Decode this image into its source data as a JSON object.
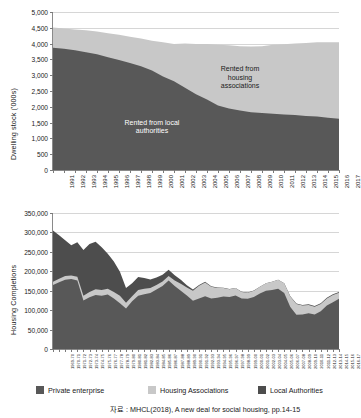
{
  "chart_data": [
    {
      "type": "area",
      "id": "dwelling-stock",
      "title": "",
      "xlabel": "",
      "ylabel": "Dwelling stock ('000s)",
      "ylim": [
        0,
        5000
      ],
      "yticks": [
        "0",
        "500",
        "1,000",
        "1,500",
        "2,000",
        "2,500",
        "3,000",
        "3,500",
        "4,000",
        "4,500",
        "5,000"
      ],
      "ytick_values": [
        0,
        500,
        1000,
        1500,
        2000,
        2500,
        3000,
        3500,
        4000,
        4500,
        5000
      ],
      "grid": true,
      "stacked": true,
      "legend_position": "in-plot-annotations",
      "categories": [
        "1991",
        "1992",
        "1993",
        "1994",
        "1995",
        "1996",
        "1997",
        "1998",
        "1999",
        "2000",
        "2001",
        "2002",
        "2003",
        "2004",
        "2005",
        "2006",
        "2007",
        "2008",
        "2009",
        "2010",
        "2011",
        "2012",
        "2013",
        "2014",
        "2015",
        "2016",
        "2017"
      ],
      "series": [
        {
          "name": "Rented from local authorities",
          "color": "#585858",
          "values": [
            3870,
            3840,
            3790,
            3730,
            3660,
            3570,
            3480,
            3390,
            3280,
            3150,
            2960,
            2810,
            2600,
            2400,
            2230,
            2040,
            1950,
            1880,
            1830,
            1800,
            1780,
            1760,
            1740,
            1710,
            1690,
            1650,
            1620
          ]
        },
        {
          "name": "Rented from housing associations",
          "color": "#c8c8c8",
          "values": [
            640,
            640,
            660,
            690,
            720,
            760,
            800,
            830,
            880,
            940,
            1080,
            1180,
            1400,
            1590,
            1760,
            1920,
            2000,
            2040,
            2080,
            2120,
            2180,
            2220,
            2260,
            2310,
            2350,
            2390,
            2420
          ]
        }
      ],
      "annotations": [
        {
          "text": "Rented from\nhousing\nassociations",
          "x": "2008",
          "y": 2950,
          "color": "#1a1a1a"
        },
        {
          "text": "Rented from local\nauthorities",
          "x": "2000",
          "y": 1250,
          "color": "#ffffff"
        }
      ]
    },
    {
      "type": "area",
      "id": "housing-completions",
      "title": "",
      "xlabel": "",
      "ylabel": "Housing Completions",
      "ylim": [
        0,
        350000
      ],
      "yticks": [
        "0",
        "50,000",
        "100,000",
        "150,000",
        "200,000",
        "250,000",
        "300,000",
        "350,000"
      ],
      "ytick_values": [
        0,
        50000,
        100000,
        150000,
        200000,
        250000,
        300000,
        350000
      ],
      "grid": true,
      "stacked": true,
      "legend_position": "bottom",
      "categories": [
        "1969-70",
        "1970-71",
        "1971-72",
        "1972-73",
        "1973-74",
        "1974-75",
        "1975-76",
        "1976-77",
        "1977-78",
        "1978-79",
        "1979-80",
        "1980-81",
        "1981-82",
        "1982-83",
        "1983-84",
        "1984-85",
        "1985-86",
        "1986-87",
        "1987-88",
        "1988-89",
        "1989-90",
        "1990-91",
        "1991-92",
        "1992-93",
        "1993-94",
        "1994-95",
        "1995-96",
        "1996-97",
        "1997-98",
        "1998-99",
        "1999-00",
        "2000-01",
        "2001-02",
        "2002-03",
        "2003-04",
        "2004-05",
        "2005-06",
        "2006-07",
        "2007-08",
        "2008-09",
        "2009-10",
        "2010-11",
        "2011-12",
        "2012-13",
        "2013-14",
        "2014-15",
        "2015-16",
        "2016-17"
      ],
      "series": [
        {
          "name": "Private enterprise",
          "color": "#585858",
          "values": [
            165000,
            172000,
            178000,
            180000,
            176000,
            125000,
            133000,
            139000,
            137000,
            140000,
            130000,
            118000,
            104000,
            123000,
            137000,
            141000,
            144000,
            153000,
            162000,
            176000,
            162000,
            150000,
            138000,
            124000,
            130000,
            136000,
            130000,
            132000,
            135000,
            134000,
            138000,
            130000,
            129000,
            134000,
            143000,
            150000,
            152000,
            155000,
            144000,
            108000,
            88000,
            89000,
            92000,
            89000,
            97000,
            112000,
            120000,
            129000
          ]
        },
        {
          "name": "Housing Associations",
          "color": "#c8c8c8",
          "values": [
            8000,
            9000,
            10000,
            9000,
            10000,
            12000,
            14000,
            15000,
            15000,
            15000,
            17000,
            19000,
            15000,
            13000,
            15000,
            14000,
            13000,
            12000,
            12000,
            12000,
            14000,
            18000,
            20000,
            26000,
            33000,
            35000,
            30000,
            25000,
            22000,
            20000,
            19000,
            17000,
            16000,
            16000,
            17000,
            19000,
            21000,
            23000,
            25000,
            27000,
            28000,
            23000,
            21000,
            20000,
            19000,
            18000,
            19000,
            16000
          ]
        },
        {
          "name": "Local Authorities",
          "color": "#4d4d4d",
          "values": [
            132000,
            112000,
            92000,
            78000,
            89000,
            118000,
            123000,
            122000,
            110000,
            90000,
            78000,
            62000,
            38000,
            33000,
            33000,
            28000,
            22000,
            19000,
            17000,
            16000,
            14000,
            10000,
            6000,
            3000,
            2000,
            2000,
            1500,
            1000,
            800,
            600,
            300,
            300,
            200,
            300,
            200,
            200,
            300,
            300,
            300,
            500,
            800,
            1500,
            2000,
            1500,
            1500,
            2000,
            2000,
            1500
          ]
        }
      ],
      "legend": [
        {
          "label": "Private enterprise",
          "color": "#585858"
        },
        {
          "label": "Housing Associations",
          "color": "#c8c8c8"
        },
        {
          "label": "Local Authorities",
          "color": "#4d4d4d"
        }
      ]
    }
  ],
  "caption": {
    "text": "자료 : MHCL(2018), A new deal for social housing, pp.14-15"
  }
}
